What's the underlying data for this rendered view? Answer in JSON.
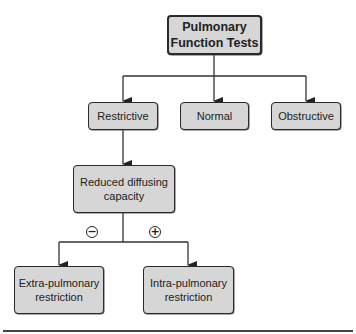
{
  "diagram": {
    "type": "flowchart",
    "nodes": {
      "root": {
        "label": "Pulmonary\nFunction Tests"
      },
      "restrictive": {
        "label": "Restrictive"
      },
      "normal": {
        "label": "Normal"
      },
      "obstructive": {
        "label": "Obstructive"
      },
      "reduced_dlco": {
        "label": "Reduced diffusing\ncapacity"
      },
      "extra_pulmonary": {
        "label": "Extra-pulmonary\nrestriction"
      },
      "intra_pulmonary": {
        "label": "Intra-pulmonary\nrestriction"
      }
    },
    "edges": [
      {
        "from": "root",
        "to": "restrictive"
      },
      {
        "from": "root",
        "to": "normal"
      },
      {
        "from": "root",
        "to": "obstructive"
      },
      {
        "from": "restrictive",
        "to": "reduced_dlco"
      },
      {
        "from": "reduced_dlco",
        "to": "extra_pulmonary",
        "label": "−"
      },
      {
        "from": "reduced_dlco",
        "to": "intra_pulmonary",
        "label": "+"
      }
    ],
    "signs": {
      "negative": "−",
      "positive": "+"
    }
  },
  "colors": {
    "box_fill": "#d6d6d6",
    "box_border": "#2a2a2a",
    "line": "#333333",
    "rule": "#444444"
  }
}
